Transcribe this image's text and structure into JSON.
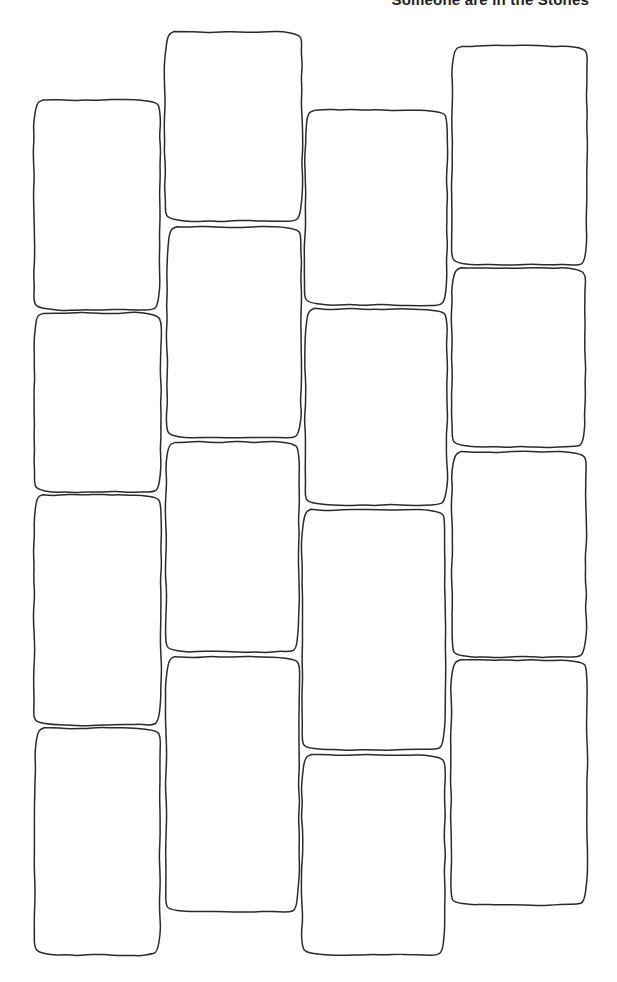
{
  "caption": "Someone are in the Stones",
  "stroke_color": "#2a2a2a",
  "background_color": "#ffffff",
  "columns": [
    {
      "stones": [
        {
          "x": 34,
          "y": 100,
          "w": 126,
          "h": 210
        },
        {
          "x": 34,
          "y": 313,
          "w": 127,
          "h": 179
        },
        {
          "x": 34,
          "y": 495,
          "w": 127,
          "h": 230
        },
        {
          "x": 35,
          "y": 728,
          "w": 125,
          "h": 227
        }
      ]
    },
    {
      "stones": [
        {
          "x": 165,
          "y": 32,
          "w": 137,
          "h": 189
        },
        {
          "x": 167,
          "y": 227,
          "w": 134,
          "h": 211
        },
        {
          "x": 166,
          "y": 442,
          "w": 133,
          "h": 210
        },
        {
          "x": 166,
          "y": 657,
          "w": 133,
          "h": 255
        }
      ]
    },
    {
      "stones": [
        {
          "x": 305,
          "y": 110,
          "w": 142,
          "h": 195
        },
        {
          "x": 305,
          "y": 309,
          "w": 142,
          "h": 196
        },
        {
          "x": 302,
          "y": 510,
          "w": 143,
          "h": 240
        },
        {
          "x": 302,
          "y": 755,
          "w": 143,
          "h": 200
        }
      ]
    },
    {
      "stones": [
        {
          "x": 452,
          "y": 46,
          "w": 135,
          "h": 219
        },
        {
          "x": 452,
          "y": 268,
          "w": 133,
          "h": 179
        },
        {
          "x": 452,
          "y": 452,
          "w": 134,
          "h": 205
        },
        {
          "x": 451,
          "y": 660,
          "w": 136,
          "h": 245
        }
      ]
    }
  ]
}
